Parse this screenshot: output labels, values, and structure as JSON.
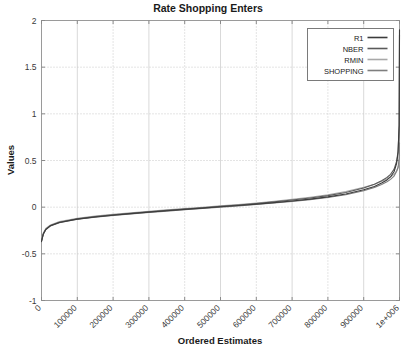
{
  "chart_data": {
    "type": "line",
    "title": "Rate Shopping Enters",
    "xlabel": "Ordered Estimates",
    "ylabel": "Values",
    "xlim": [
      0,
      1000000
    ],
    "ylim": [
      -1,
      2
    ],
    "grid": true,
    "legend_position": "top-right",
    "xticks": [
      0,
      100000,
      200000,
      300000,
      400000,
      500000,
      600000,
      700000,
      800000,
      900000,
      1000000
    ],
    "xticklabels": [
      "0",
      "100000",
      "200000",
      "300000",
      "400000",
      "500000",
      "600000",
      "700000",
      "800000",
      "900000",
      "1e+006"
    ],
    "yticks": [
      -1,
      -0.5,
      0,
      0.5,
      1,
      1.5,
      2
    ],
    "yticklabels": [
      "-1",
      "-0.5",
      "0",
      "0.5",
      "1",
      "1.5",
      "2"
    ],
    "x": [
      0,
      5000,
      12000,
      25000,
      50000,
      100000,
      150000,
      200000,
      250000,
      300000,
      350000,
      400000,
      450000,
      500000,
      550000,
      600000,
      650000,
      700000,
      750000,
      800000,
      850000,
      900000,
      930000,
      950000,
      965000,
      975000,
      985000,
      992000,
      996000,
      999000,
      1000000
    ],
    "series": [
      {
        "name": "R1",
        "color": "#3c3c3c",
        "values": [
          -0.37,
          -0.29,
          -0.24,
          -0.2,
          -0.165,
          -0.128,
          -0.105,
          -0.086,
          -0.069,
          -0.053,
          -0.038,
          -0.024,
          -0.01,
          0.004,
          0.018,
          0.033,
          0.049,
          0.066,
          0.086,
          0.11,
          0.141,
          0.186,
          0.222,
          0.258,
          0.292,
          0.325,
          0.382,
          0.47,
          0.585,
          0.88,
          1.9
        ]
      },
      {
        "name": "NBER",
        "color": "#5a5a5a",
        "values": [
          -0.36,
          -0.285,
          -0.236,
          -0.197,
          -0.162,
          -0.125,
          -0.101,
          -0.082,
          -0.065,
          -0.049,
          -0.034,
          -0.02,
          -0.006,
          0.009,
          0.024,
          0.04,
          0.057,
          0.076,
          0.098,
          0.124,
          0.158,
          0.206,
          0.245,
          0.283,
          0.318,
          0.352,
          0.408,
          0.492,
          0.6,
          0.87,
          1.85
        ]
      },
      {
        "name": "RMIN",
        "color": "#a8a8a8",
        "values": [
          -0.355,
          -0.278,
          -0.229,
          -0.19,
          -0.155,
          -0.118,
          -0.095,
          -0.076,
          -0.06,
          -0.044,
          -0.029,
          -0.015,
          -0.001,
          0.014,
          0.029,
          0.045,
          0.063,
          0.083,
          0.106,
          0.133,
          0.167,
          0.212,
          0.246,
          0.277,
          0.303,
          0.325,
          0.352,
          0.388,
          0.42,
          0.47,
          0.56
        ]
      },
      {
        "name": "SHOPPING",
        "color": "#7e7e7e",
        "values": [
          -0.365,
          -0.288,
          -0.24,
          -0.201,
          -0.166,
          -0.13,
          -0.107,
          -0.088,
          -0.072,
          -0.056,
          -0.042,
          -0.028,
          -0.014,
          0.0,
          0.014,
          0.029,
          0.045,
          0.062,
          0.081,
          0.104,
          0.133,
          0.176,
          0.21,
          0.243,
          0.272,
          0.298,
          0.333,
          0.385,
          0.43,
          0.52,
          0.69
        ]
      }
    ]
  }
}
